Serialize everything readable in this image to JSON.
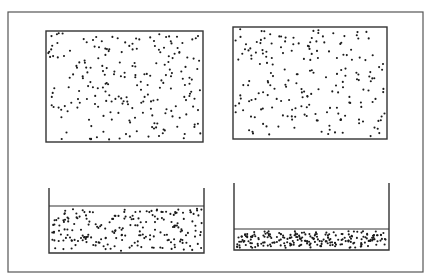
{
  "figure": {
    "stroke_color": "#333333",
    "dot_color": "#1a1a1a",
    "background": "#ffffff",
    "outer_frame": {
      "x": 8,
      "y": 12,
      "w": 415,
      "h": 260
    },
    "panels": [
      {
        "id": "gas-left",
        "type": "closed-box",
        "x": 46,
        "y": 31,
        "w": 157,
        "h": 111,
        "fill": {
          "x": 46,
          "y": 31,
          "w": 157,
          "h": 111
        },
        "particle_count": 220,
        "seed": 11
      },
      {
        "id": "gas-right",
        "type": "closed-box",
        "x": 233,
        "y": 27,
        "w": 154,
        "h": 112,
        "fill": {
          "x": 233,
          "y": 27,
          "w": 154,
          "h": 112
        },
        "particle_count": 200,
        "seed": 27
      },
      {
        "id": "liquid-left",
        "type": "open-container",
        "x": 49,
        "wall_top": 188,
        "w": 155,
        "bottom": 253,
        "liquid_top": 206,
        "fill": {
          "x": 49,
          "y": 206,
          "w": 155,
          "h": 47
        },
        "particle_count": 210,
        "seed": 53
      },
      {
        "id": "liquid-right",
        "type": "open-container",
        "x": 234,
        "wall_top": 183,
        "w": 155,
        "bottom": 250,
        "liquid_top": 229,
        "fill": {
          "x": 234,
          "y": 229,
          "w": 155,
          "h": 21
        },
        "particle_count": 230,
        "seed": 89
      }
    ]
  }
}
